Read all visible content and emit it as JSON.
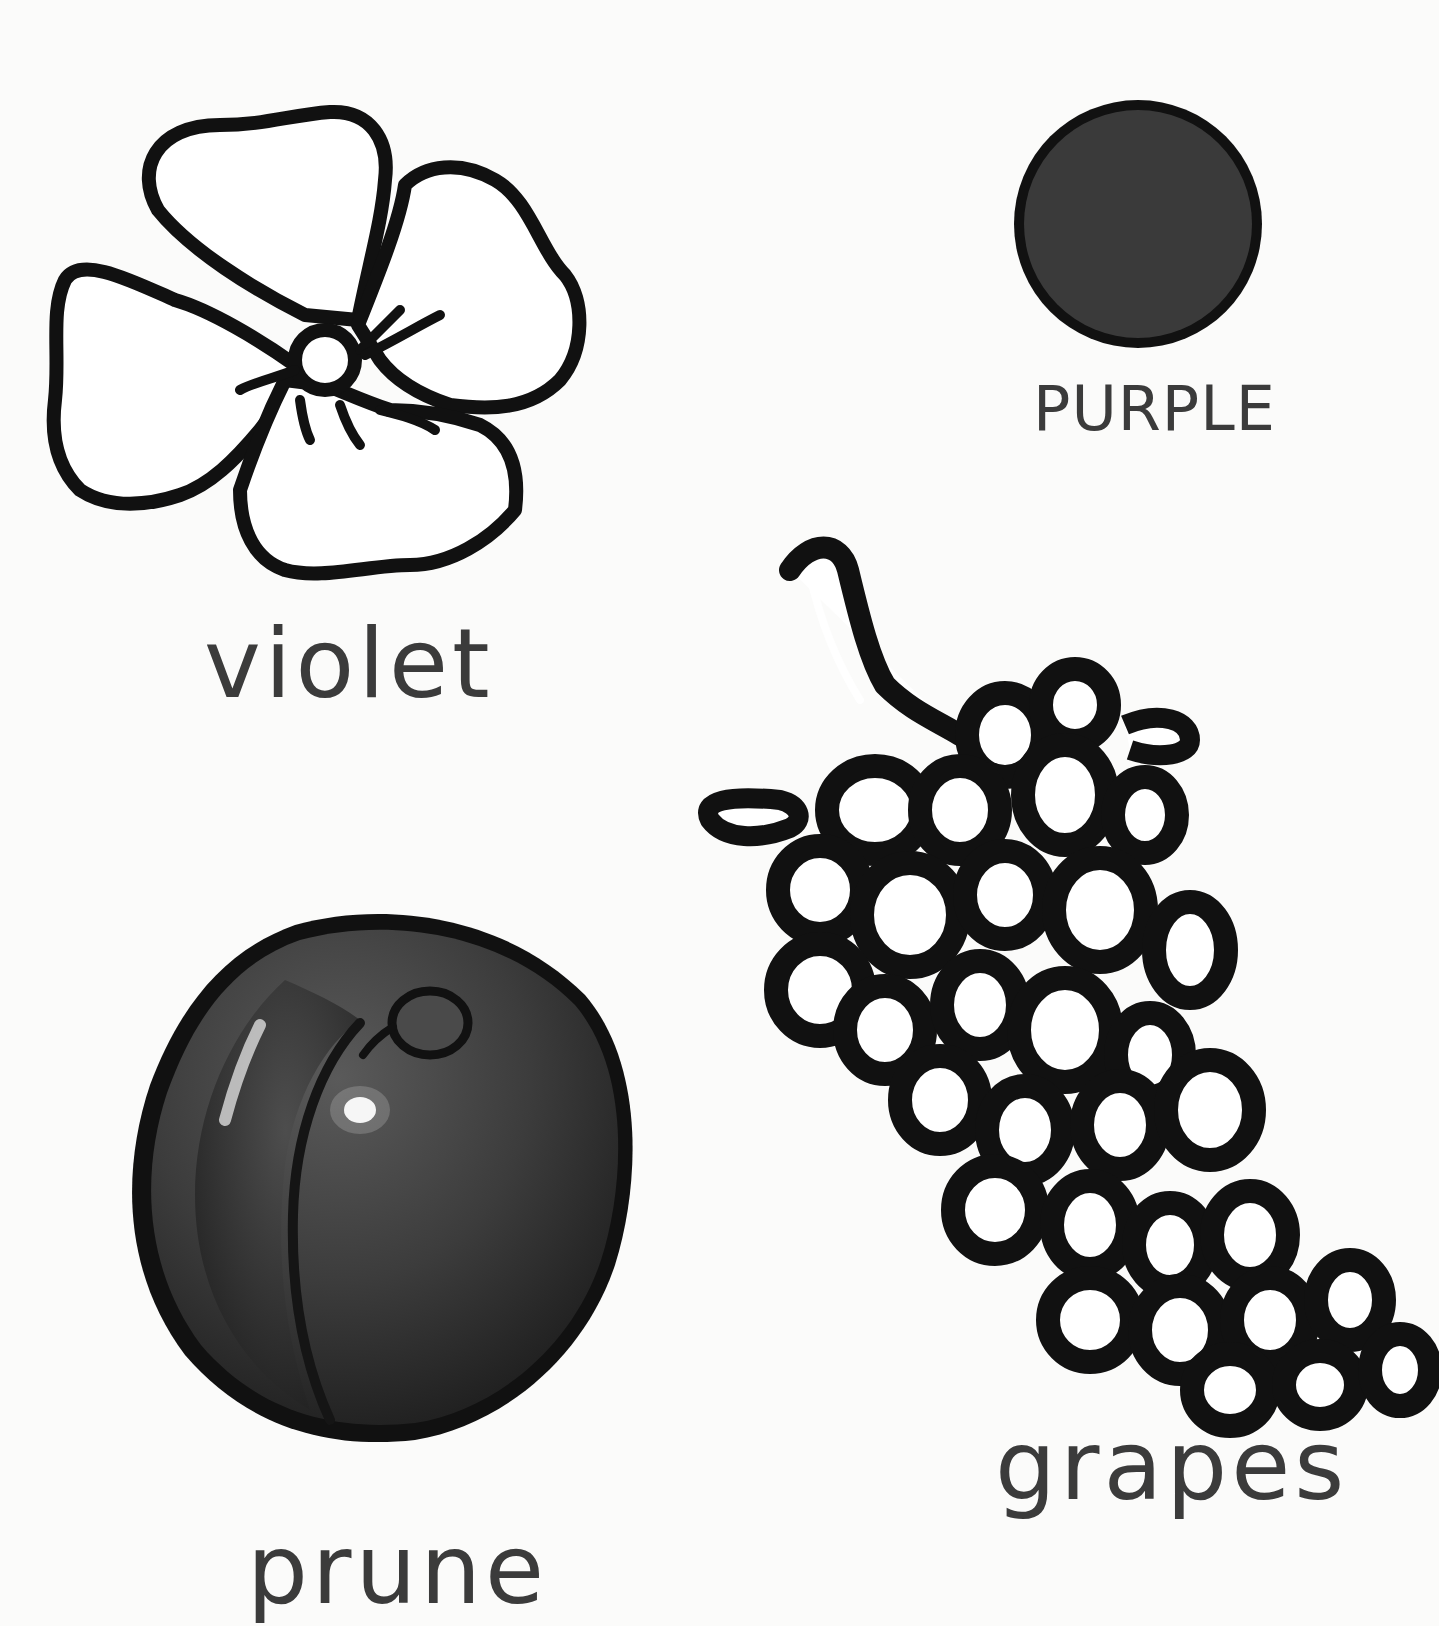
{
  "page": {
    "background": "#fbfbfa",
    "ink": "#111111",
    "label_color": "#3b3b3b"
  },
  "swatch": {
    "label": "PURPLE",
    "fill": "#3a3a3a",
    "outline": "#111111"
  },
  "items": [
    {
      "id": "violet",
      "label": "violet",
      "drawing": "flower-line-art"
    },
    {
      "id": "prune",
      "label": "prune",
      "drawing": "plum-illustration"
    },
    {
      "id": "grapes",
      "label": "grapes",
      "drawing": "grape-bunch-line-art"
    }
  ]
}
